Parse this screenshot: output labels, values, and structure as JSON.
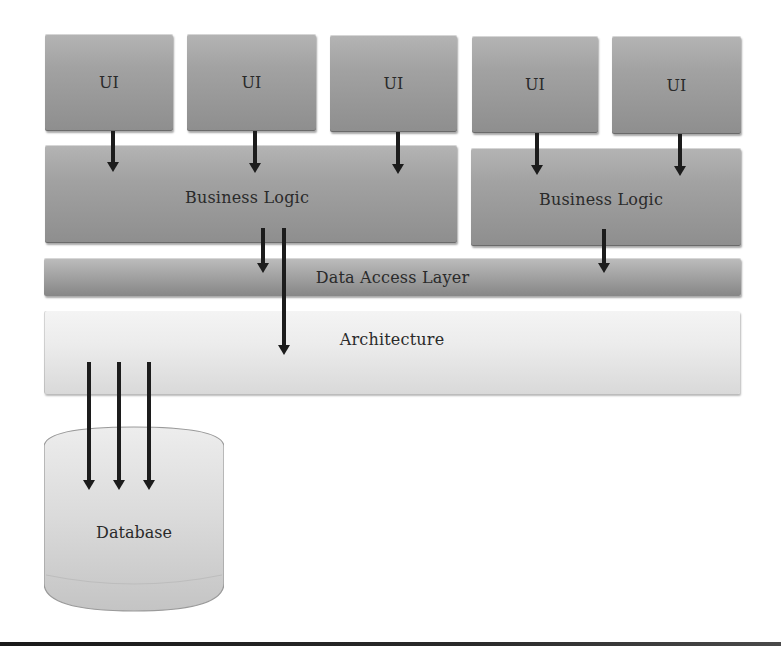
{
  "diagram": {
    "ui_boxes": [
      {
        "label": "UI"
      },
      {
        "label": "UI"
      },
      {
        "label": "UI"
      },
      {
        "label": "UI"
      },
      {
        "label": "UI"
      }
    ],
    "business_logic": [
      {
        "label": "Business Logic"
      },
      {
        "label": "Business Logic"
      }
    ],
    "data_access_layer": {
      "label": "Data Access Layer"
    },
    "architecture": {
      "label": "Architecture"
    },
    "database": {
      "label": "Database"
    },
    "colors": {
      "box_dark": "#a2a2a2",
      "box_light": "#ececec",
      "arrow": "#1c1c1c",
      "text": "#2a2a2a"
    },
    "connections": [
      {
        "from": "UI 1",
        "to": "Business Logic 1"
      },
      {
        "from": "UI 2",
        "to": "Business Logic 1"
      },
      {
        "from": "UI 3",
        "to": "Business Logic 1"
      },
      {
        "from": "UI 4",
        "to": "Business Logic 2"
      },
      {
        "from": "UI 5",
        "to": "Business Logic 2"
      },
      {
        "from": "Business Logic 1",
        "to": "Data Access Layer"
      },
      {
        "from": "Business Logic 1",
        "to": "Architecture"
      },
      {
        "from": "Business Logic 2",
        "to": "Data Access Layer"
      },
      {
        "from": "Architecture",
        "to": "Database"
      },
      {
        "from": "Architecture",
        "to": "Database"
      },
      {
        "from": "Architecture",
        "to": "Database"
      }
    ]
  }
}
